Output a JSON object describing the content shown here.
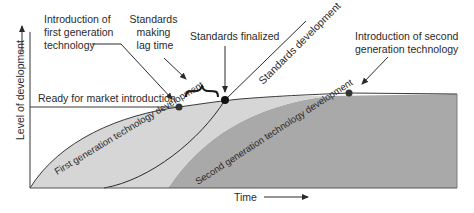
{
  "diagram": {
    "axes": {
      "y_label": "Level of development",
      "x_label": "Time"
    },
    "annotations": {
      "first_gen_intro": [
        "Introduction of",
        "first generation",
        "technology"
      ],
      "standards_lag": [
        "Standards",
        "making",
        "lag time"
      ],
      "standards_finalized": "Standards finalized",
      "standards_development": "Standards development",
      "second_gen_intro": [
        "Introduction of second",
        "generation technology"
      ],
      "ready_for_market": "Ready for market introduction"
    },
    "regions": {
      "first_gen": "First generation technology development",
      "second_gen": "Second generation technology development"
    },
    "colors": {
      "first_gen_fill": "#d6d6d6",
      "second_gen_fill": "#a9a9a9",
      "line": "#3a3a3a",
      "dot": "#1a1a1a"
    }
  }
}
